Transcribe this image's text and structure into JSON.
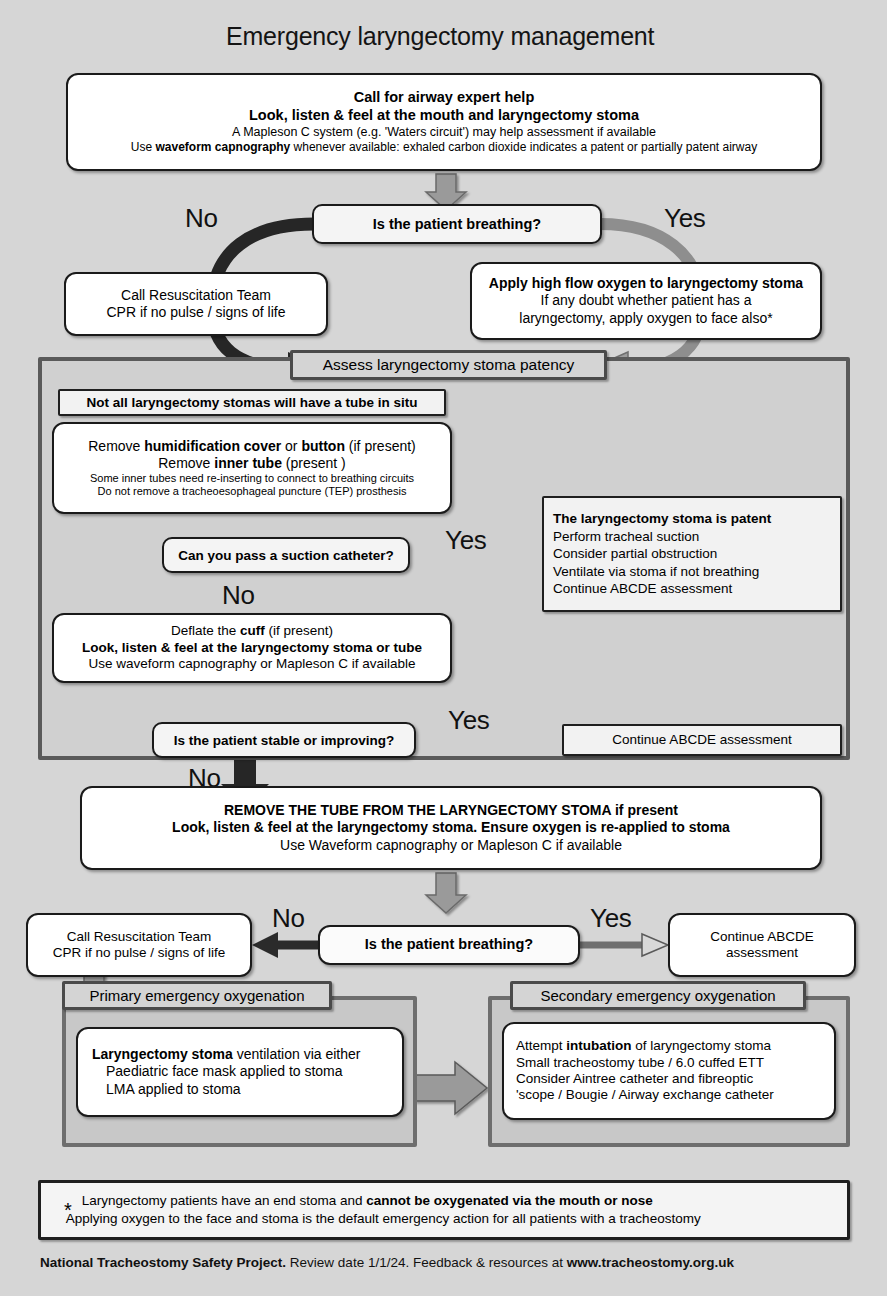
{
  "page": {
    "title": "Emergency laryngectomy management",
    "background_color": "#d6d6d6",
    "arrow_dark_color": "#2b2b2b",
    "arrow_gray_color": "#8c8c8c"
  },
  "start_box": {
    "line1": "Call for airway expert help",
    "line2": "Look, listen & feel at the mouth and laryngectomy stoma",
    "line3": "A Mapleson C system (e.g. 'Waters circuit') may help assessment if available",
    "line4_a": "Use ",
    "line4_b": "waveform capnography",
    "line4_c": " whenever available:  exhaled carbon dioxide indicates a patent or partially patent airway"
  },
  "decision1": {
    "question": "Is the patient breathing?",
    "no_label": "No",
    "yes_label": "Yes"
  },
  "resus_box_1": {
    "line1": "Call Resuscitation Team",
    "line2": "CPR if no pulse / signs of life"
  },
  "oxygen_box": {
    "line1": "Apply high flow oxygen to laryngectomy stoma",
    "line2": "If any doubt whether patient has a",
    "line3": "laryngectomy, apply oxygen to face also*"
  },
  "assess_panel": {
    "header": "Assess laryngectomy stoma patency",
    "note_tube": "Not all laryngectomy stomas will have a tube in situ",
    "remove_box": {
      "line1_a": "Remove ",
      "line1_b": "humidification cover",
      "line1_c": " or ",
      "line1_d": "button",
      "line1_e": " (if present)",
      "line2_a": "Remove ",
      "line2_b": "inner tube",
      "line2_c": " (present )",
      "line3": "Some inner tubes need re-inserting to connect to breathing circuits",
      "line4": "Do not remove a tracheoesophageal puncture (TEP) prosthesis"
    },
    "decision_suction": {
      "question": "Can you pass a suction catheter?",
      "yes_label": "Yes",
      "no_label": "No"
    },
    "patent_box": {
      "line1": "The laryngectomy stoma is patent",
      "line2": "Perform tracheal suction",
      "line3": "Consider partial obstruction",
      "line4": "Ventilate via stoma if not breathing",
      "line5": "Continue ABCDE assessment"
    },
    "deflate_box": {
      "line1_a": "Deflate the ",
      "line1_b": "cuff",
      "line1_c": " (if present)",
      "line2": "Look, listen & feel at the laryngectomy stoma or tube",
      "line3": "Use waveform capnography or Mapleson C if available"
    },
    "decision_stable": {
      "question": "Is the patient stable or improving?",
      "yes_label": "Yes",
      "no_label": "No"
    },
    "continue_box": "Continue ABCDE assessment"
  },
  "remove_tube_box": {
    "line1": "REMOVE THE TUBE FROM THE LARYNGECTOMY STOMA if present",
    "line2": "Look, listen & feel at the laryngectomy stoma. Ensure oxygen is re-applied to stoma",
    "line3": "Use Waveform capnography or Mapleson C if available"
  },
  "decision2": {
    "question": "Is the patient breathing?",
    "no_label": "No",
    "yes_label": "Yes"
  },
  "resus_box_2": {
    "line1": "Call Resuscitation Team",
    "line2": "CPR if no pulse / signs of life"
  },
  "continue_box_2": {
    "line1": "Continue ABCDE",
    "line2": "assessment"
  },
  "primary_oxygenation": {
    "header": "Primary emergency oxygenation",
    "line1_a": "Laryngectomy stoma",
    "line1_b": " ventilation via either",
    "line2": "Paediatric face mask applied to stoma",
    "line3": "LMA applied to stoma"
  },
  "secondary_oxygenation": {
    "header": "Secondary emergency oxygenation",
    "line1_a": "Attempt ",
    "line1_b": "intubation",
    "line1_c": " of laryngectomy stoma",
    "line2": "Small tracheostomy tube / 6.0 cuffed ETT",
    "line3": "Consider Aintree catheter and fibreoptic",
    "line4": "'scope / Bougie / Airway exchange catheter"
  },
  "footnote": {
    "marker": "*",
    "line1_a": "Laryngectomy patients have an end stoma and ",
    "line1_b": "cannot be oxygenated via the mouth or nose",
    "line2": "Applying oxygen to the face and stoma is the default emergency action for all patients with a tracheostomy"
  },
  "credit": {
    "bold1": "National Tracheostomy Safety Project.",
    "normal": " Review date 1/1/24. Feedback & resources at ",
    "bold2": "www.tracheostomy.org.uk"
  }
}
